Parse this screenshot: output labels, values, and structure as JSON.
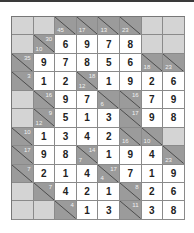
{
  "puzzle": {
    "type": "kakuro",
    "cols": 8,
    "rows": 11,
    "colors": {
      "clue": "#9b9b9b",
      "blank": "#d4d4d4",
      "value_bg": "#ffffff"
    },
    "grid": [
      [
        {
          "t": "b"
        },
        {
          "t": "b"
        },
        {
          "t": "c",
          "d": "45"
        },
        {
          "t": "c",
          "d": "17"
        },
        {
          "t": "c",
          "d": "13"
        },
        {
          "t": "c",
          "d": "23"
        },
        {
          "t": "b"
        },
        {
          "t": "b"
        }
      ],
      [
        {
          "t": "b"
        },
        {
          "t": "c",
          "d": "10",
          "r": "30"
        },
        {
          "t": "v",
          "v": "6"
        },
        {
          "t": "v",
          "v": "9"
        },
        {
          "t": "v",
          "v": "7"
        },
        {
          "t": "v",
          "v": "8"
        },
        {
          "t": "b"
        },
        {
          "t": "b"
        }
      ],
      [
        {
          "t": "c",
          "r": "35"
        },
        {
          "t": "v",
          "v": "9"
        },
        {
          "t": "v",
          "v": "7"
        },
        {
          "t": "v",
          "v": "8"
        },
        {
          "t": "v",
          "v": "5"
        },
        {
          "t": "v",
          "v": "6"
        },
        {
          "t": "c",
          "d": "18"
        },
        {
          "t": "c",
          "d": "23"
        }
      ],
      [
        {
          "t": "c",
          "r": "3"
        },
        {
          "t": "v",
          "v": "1"
        },
        {
          "t": "v",
          "v": "2"
        },
        {
          "t": "c",
          "d": "12",
          "r": "18"
        },
        {
          "t": "v",
          "v": "1"
        },
        {
          "t": "v",
          "v": "9"
        },
        {
          "t": "v",
          "v": "2"
        },
        {
          "t": "v",
          "v": "6"
        }
      ],
      [
        {
          "t": "b"
        },
        {
          "t": "c",
          "r": "16"
        },
        {
          "t": "v",
          "v": "9"
        },
        {
          "t": "v",
          "v": "7"
        },
        {
          "t": "c",
          "d": "6"
        },
        {
          "t": "c",
          "r": "16"
        },
        {
          "t": "v",
          "v": "7"
        },
        {
          "t": "v",
          "v": "9"
        }
      ],
      [
        {
          "t": "b"
        },
        {
          "t": "c",
          "d": "12",
          "r": "9"
        },
        {
          "t": "v",
          "v": "5"
        },
        {
          "t": "v",
          "v": "1"
        },
        {
          "t": "v",
          "v": "3"
        },
        {
          "t": "c",
          "r": "17"
        },
        {
          "t": "v",
          "v": "9"
        },
        {
          "t": "v",
          "v": "8"
        }
      ],
      [
        {
          "t": "c",
          "r": "10"
        },
        {
          "t": "v",
          "v": "1"
        },
        {
          "t": "v",
          "v": "3"
        },
        {
          "t": "v",
          "v": "4"
        },
        {
          "t": "v",
          "v": "2"
        },
        {
          "t": "c",
          "d": "16"
        },
        {
          "t": "c",
          "d": "10"
        },
        {
          "t": "b"
        }
      ],
      [
        {
          "t": "c",
          "r": "17"
        },
        {
          "t": "v",
          "v": "9"
        },
        {
          "t": "v",
          "v": "8"
        },
        {
          "t": "c",
          "d": "7",
          "r": "14"
        },
        {
          "t": "v",
          "v": "1"
        },
        {
          "t": "v",
          "v": "9"
        },
        {
          "t": "v",
          "v": "4"
        },
        {
          "t": "c",
          "d": "23"
        }
      ],
      [
        {
          "t": "c",
          "r": "7"
        },
        {
          "t": "v",
          "v": "2"
        },
        {
          "t": "v",
          "v": "1"
        },
        {
          "t": "v",
          "v": "4"
        },
        {
          "t": "c",
          "d": "4",
          "r": "17"
        },
        {
          "t": "v",
          "v": "7"
        },
        {
          "t": "v",
          "v": "1"
        },
        {
          "t": "v",
          "v": "9"
        }
      ],
      [
        {
          "t": "b"
        },
        {
          "t": "c",
          "r": "7"
        },
        {
          "t": "v",
          "v": "4"
        },
        {
          "t": "v",
          "v": "2"
        },
        {
          "t": "v",
          "v": "1"
        },
        {
          "t": "c",
          "r": "8"
        },
        {
          "t": "v",
          "v": "2"
        },
        {
          "t": "v",
          "v": "6"
        }
      ],
      [
        {
          "t": "b"
        },
        {
          "t": "b"
        },
        {
          "t": "c",
          "r": "4"
        },
        {
          "t": "v",
          "v": "1"
        },
        {
          "t": "v",
          "v": "3"
        },
        {
          "t": "c",
          "r": "11"
        },
        {
          "t": "v",
          "v": "3"
        },
        {
          "t": "v",
          "v": "8"
        }
      ]
    ]
  }
}
